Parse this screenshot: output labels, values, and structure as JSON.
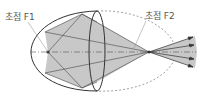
{
  "diagram": {
    "labels": {
      "focus1": "초점 F1",
      "focus2": "초점 F2"
    },
    "colors": {
      "fill": "#c8c8c8",
      "stroke": "#333333",
      "dashed": "#888888",
      "text": "#555555"
    }
  }
}
